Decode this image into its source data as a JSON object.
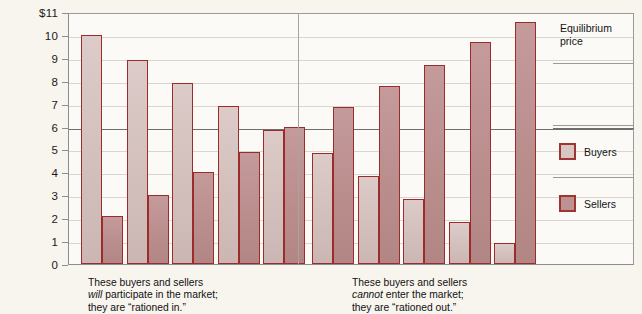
{
  "chart_data": {
    "type": "bar",
    "title": "",
    "subtitle": "",
    "xlabel": "",
    "ylabel": "",
    "ylim": [
      0,
      11
    ],
    "grid": true,
    "legend_position": "right",
    "y_ticks": [
      "0",
      "1",
      "2",
      "3",
      "4",
      "5",
      "6",
      "7",
      "8",
      "9",
      "10",
      "$11"
    ],
    "y_tick_values": [
      0,
      1,
      2,
      3,
      4,
      5,
      6,
      7,
      8,
      9,
      10,
      11
    ],
    "categories": [
      "1",
      "2",
      "3",
      "4",
      "5",
      "6",
      "7",
      "8",
      "9",
      "10"
    ],
    "series": [
      {
        "name": "Buyers",
        "color": "#d8c6c3",
        "values": [
          10.0,
          8.9,
          7.9,
          6.9,
          5.85,
          4.85,
          3.85,
          2.85,
          1.85,
          0.9
        ]
      },
      {
        "name": "Sellers",
        "color": "#bd9292",
        "values": [
          2.1,
          3.0,
          4.0,
          4.9,
          6.0,
          6.85,
          7.75,
          8.7,
          9.7,
          10.55
        ]
      }
    ],
    "annotations": [
      {
        "name": "equilibrium-price-line",
        "label": "Equilibrium price",
        "value": 6,
        "color": "#6e6e6e"
      }
    ],
    "groups": [
      {
        "name": "rationed-in",
        "pair_indices": [
          0,
          1,
          2,
          3,
          4
        ],
        "caption_line1": "These buyers and sellers",
        "caption_line2_emphasis": "will",
        "caption_line2_rest": " participate in the market;",
        "caption_line3": "they are “rationed in.”"
      },
      {
        "name": "rationed-out",
        "pair_indices": [
          5,
          6,
          7,
          8,
          9
        ],
        "caption_line1": "These buyers and sellers",
        "caption_line2_emphasis": "cannot",
        "caption_line2_rest": " enter the market;",
        "caption_line3": "they are “rationed out.”"
      }
    ]
  },
  "legend": {
    "equilibrium_label_line1": "Equilibrium",
    "equilibrium_label_line2": "price",
    "entries": [
      {
        "label": "Buyers",
        "color": "#d8c6c3"
      },
      {
        "label": "Sellers",
        "color": "#bd9292"
      }
    ]
  },
  "captions": {
    "left": {
      "line1": "These buyers and sellers",
      "emphasis": "will",
      "line2_rest": " participate in the market;",
      "line3": "they are “rationed in.”"
    },
    "right": {
      "line1": "These buyers and sellers",
      "emphasis": "cannot",
      "line2_rest": " enter the market;",
      "line3": "they are “rationed out.”"
    }
  },
  "colors": {
    "background": "#f8f5ef",
    "plot_background": "#fbfaf7",
    "bar_border": "#9c2b2b",
    "gridline": "#d9d6d0",
    "equilibrium_line": "#6e6e6e",
    "axis": "#8d8d8d",
    "text": "#141414"
  }
}
